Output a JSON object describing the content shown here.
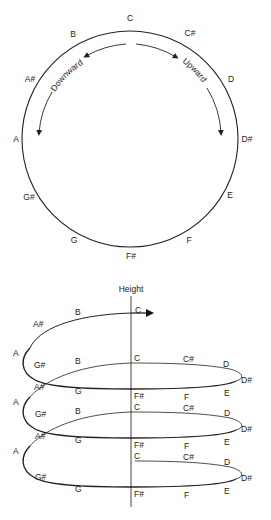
{
  "pitch_circle": {
    "notes": [
      {
        "name": "C",
        "x": 130,
        "y": 21
      },
      {
        "name": "C#",
        "x": 190,
        "y": 36
      },
      {
        "name": "D",
        "x": 231,
        "y": 80
      },
      {
        "name": "D#",
        "x": 246,
        "y": 139
      },
      {
        "name": "E",
        "x": 230,
        "y": 197
      },
      {
        "name": "F",
        "x": 189,
        "y": 241
      },
      {
        "name": "F#",
        "x": 131,
        "y": 257
      },
      {
        "name": "G",
        "x": 74,
        "y": 241
      },
      {
        "name": "G#",
        "x": 29,
        "y": 198
      },
      {
        "name": "A",
        "x": 16,
        "y": 140
      },
      {
        "name": "A#",
        "x": 30,
        "y": 80
      },
      {
        "name": "B",
        "x": 72,
        "y": 36
      }
    ],
    "arrows": {
      "downward_label": "Downward",
      "upward_label": "Upward"
    }
  },
  "pitch_helix": {
    "axis_label": "Height",
    "labels": [
      {
        "name": "C",
        "x": 135,
        "y": 313
      },
      {
        "name": "B",
        "x": 78,
        "y": 315
      },
      {
        "name": "A#",
        "x": 38,
        "y": 327
      },
      {
        "name": "A",
        "x": 16,
        "y": 355
      },
      {
        "name": "G#",
        "x": 38,
        "y": 368
      },
      {
        "name": "B",
        "x": 78,
        "y": 364
      },
      {
        "name": "C",
        "x": 135,
        "y": 361
      },
      {
        "name": "C#",
        "x": 187,
        "y": 361
      },
      {
        "name": "D",
        "x": 226,
        "y": 366
      },
      {
        "name": "D#",
        "x": 244,
        "y": 380
      },
      {
        "name": "A#",
        "x": 38,
        "y": 390
      },
      {
        "name": "G",
        "x": 78,
        "y": 393
      },
      {
        "name": "F#",
        "x": 135,
        "y": 398
      },
      {
        "name": "F",
        "x": 187,
        "y": 398
      },
      {
        "name": "E",
        "x": 226,
        "y": 395
      },
      {
        "name": "A",
        "x": 16,
        "y": 404
      },
      {
        "name": "C",
        "x": 135,
        "y": 410
      },
      {
        "name": "C#",
        "x": 187,
        "y": 410
      },
      {
        "name": "G#",
        "x": 38,
        "y": 417
      },
      {
        "name": "B",
        "x": 78,
        "y": 414
      },
      {
        "name": "D",
        "x": 226,
        "y": 415
      },
      {
        "name": "D#",
        "x": 244,
        "y": 429
      },
      {
        "name": "A#",
        "x": 38,
        "y": 438
      },
      {
        "name": "G",
        "x": 78,
        "y": 442
      },
      {
        "name": "F#",
        "x": 135,
        "y": 447
      },
      {
        "name": "F",
        "x": 187,
        "y": 447
      },
      {
        "name": "E",
        "x": 226,
        "y": 443
      },
      {
        "name": "A",
        "x": 16,
        "y": 453
      },
      {
        "name": "C",
        "x": 135,
        "y": 459
      },
      {
        "name": "C#",
        "x": 187,
        "y": 459
      },
      {
        "name": "D",
        "x": 226,
        "y": 464
      },
      {
        "name": "G#",
        "x": 38,
        "y": 480
      },
      {
        "name": "D#",
        "x": 244,
        "y": 479
      },
      {
        "name": "G",
        "x": 78,
        "y": 491
      },
      {
        "name": "F#",
        "x": 135,
        "y": 496
      },
      {
        "name": "F",
        "x": 187,
        "y": 496
      },
      {
        "name": "E",
        "x": 226,
        "y": 492
      }
    ]
  }
}
